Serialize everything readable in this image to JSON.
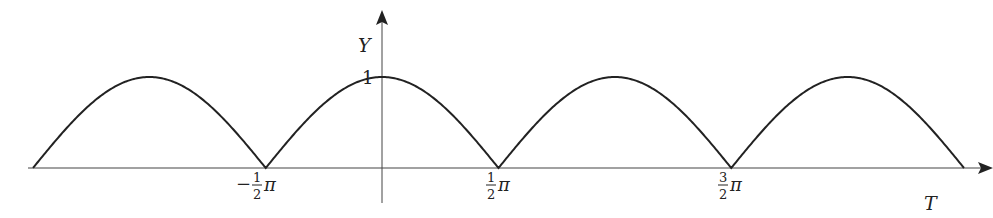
{
  "chart_data": {
    "type": "line",
    "title": "",
    "function": "Y = |cos T|",
    "xlabel": "T",
    "ylabel": "Y",
    "x_ticks": [
      {
        "value": -1.5708,
        "label_sign": "−",
        "label_num": "1",
        "label_den": "2",
        "label_sym": "π"
      },
      {
        "value": 1.5708,
        "label_sign": "",
        "label_num": "1",
        "label_den": "2",
        "label_sym": "π"
      },
      {
        "value": 4.7124,
        "label_sign": "",
        "label_num": "3",
        "label_den": "2",
        "label_sym": "π"
      }
    ],
    "y_ticks": [
      {
        "value": 1,
        "label": "1"
      }
    ],
    "xlim": [
      -4.712,
      7.854
    ],
    "ylim": [
      0,
      1
    ],
    "grid": false,
    "legend": null,
    "series": [
      {
        "name": "|cos T|",
        "x": [
          -4.712,
          -3.927,
          -3.142,
          -2.356,
          -1.571,
          -0.785,
          0,
          0.785,
          1.571,
          2.356,
          3.142,
          3.927,
          4.712,
          5.498,
          6.283,
          7.069,
          7.854
        ],
        "y": [
          0,
          0.707,
          1,
          0.707,
          0,
          0.707,
          1,
          0.707,
          0,
          0.707,
          1,
          0.707,
          0,
          0.707,
          1,
          0.707,
          0
        ]
      }
    ]
  },
  "labels": {
    "y_axis": "Y",
    "x_axis": "T",
    "y_one": "1"
  },
  "colors": {
    "curve": "#222222",
    "axis": "#333333"
  }
}
